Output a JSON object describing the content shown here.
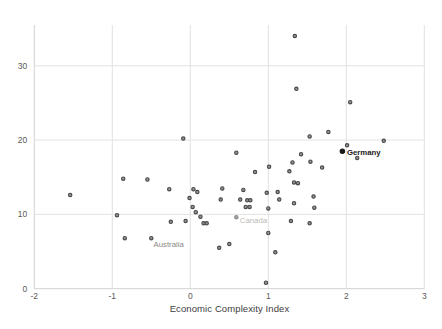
{
  "figure": {
    "background": "#ffffff",
    "width": 442,
    "height": 329
  },
  "chart_data": {
    "type": "scatter",
    "title": "",
    "xlabel": "Economic Complexity Index",
    "ylabel": "",
    "xlim": [
      -2,
      3
    ],
    "ylim": [
      0,
      35.5
    ],
    "x_ticks": [
      -2,
      -1,
      0,
      1,
      2,
      3
    ],
    "y_ticks": [
      0,
      10,
      20,
      30
    ],
    "grid": true,
    "legend": false,
    "colors": {
      "marker_fill": "#949494",
      "marker_stroke": "#484848",
      "gridline": "#e2e2e2",
      "axis_line": "#d2d2d2",
      "tick_label": "#595959",
      "axis_title": "#3d3d3d"
    },
    "points": [
      [
        1.34,
        34.0
      ],
      [
        1.36,
        26.9
      ],
      [
        2.05,
        25.1
      ],
      [
        1.77,
        21.1
      ],
      [
        1.53,
        20.5
      ],
      [
        2.48,
        19.9
      ],
      [
        2.01,
        19.3
      ],
      [
        2.14,
        17.6
      ],
      [
        0.59,
        18.3
      ],
      [
        -0.09,
        20.2
      ],
      [
        1.42,
        18.1
      ],
      [
        1.54,
        17.1
      ],
      [
        1.31,
        17.0
      ],
      [
        1.69,
        16.3
      ],
      [
        1.01,
        16.4
      ],
      [
        0.83,
        15.7
      ],
      [
        1.27,
        15.8
      ],
      [
        1.33,
        14.3
      ],
      [
        1.38,
        14.2
      ],
      [
        0.98,
        12.9
      ],
      [
        1.12,
        13.0
      ],
      [
        1.14,
        12.0
      ],
      [
        1.33,
        11.5
      ],
      [
        1.58,
        12.4
      ],
      [
        1.59,
        10.9
      ],
      [
        1.0,
        10.8
      ],
      [
        1.29,
        9.1
      ],
      [
        1.53,
        8.8
      ],
      [
        1.0,
        7.5
      ],
      [
        -0.27,
        13.4
      ],
      [
        0.04,
        13.4
      ],
      [
        0.09,
        13.0
      ],
      [
        -0.01,
        12.2
      ],
      [
        0.41,
        13.5
      ],
      [
        0.39,
        12.0
      ],
      [
        0.68,
        13.3
      ],
      [
        0.64,
        12.0
      ],
      [
        0.73,
        11.9
      ],
      [
        0.77,
        11.9
      ],
      [
        0.71,
        11.0
      ],
      [
        0.76,
        11.0
      ],
      [
        0.03,
        11.0
      ],
      [
        0.07,
        10.3
      ],
      [
        0.13,
        9.7
      ],
      [
        -0.06,
        9.1
      ],
      [
        0.17,
        8.8
      ],
      [
        0.21,
        8.8
      ],
      [
        -0.25,
        9.0
      ],
      [
        -1.54,
        12.6
      ],
      [
        -0.86,
        14.8
      ],
      [
        -0.55,
        14.7
      ],
      [
        -0.94,
        9.9
      ],
      [
        -0.84,
        6.8
      ],
      [
        0.37,
        5.5
      ],
      [
        0.5,
        6.0
      ],
      [
        1.09,
        4.9
      ],
      [
        0.97,
        0.8
      ]
    ],
    "labeled_points": [
      {
        "label": "Germany",
        "x": 1.95,
        "y": 18.5,
        "bold": true,
        "label_color": "#1a1a1a",
        "dot_fill": "#1a1a1a",
        "dot_stroke": "#1a1a1a",
        "dx": 4.5,
        "dy": 3.5
      },
      {
        "label": "Canada",
        "x": 0.59,
        "y": 9.6,
        "bold": false,
        "label_color": "#bdbbb8",
        "dot_fill": "#aaaaaa",
        "dot_stroke": "#8a8a8a",
        "dx": 3.5,
        "dy": 5.5
      },
      {
        "label": "Australia",
        "x": -0.5,
        "y": 6.8,
        "bold": false,
        "label_color": "#8a8886",
        "dot_fill": "#949494",
        "dot_stroke": "#484848",
        "dx": 2.2,
        "dy": 8.5
      }
    ],
    "layout": {
      "plot_left_px": 34.3,
      "plot_right_px": 424.3,
      "plot_top_px": 25,
      "plot_bottom_px": 288.7,
      "px_per_x_unit": 78,
      "px_per_y_unit": 7.43
    }
  }
}
